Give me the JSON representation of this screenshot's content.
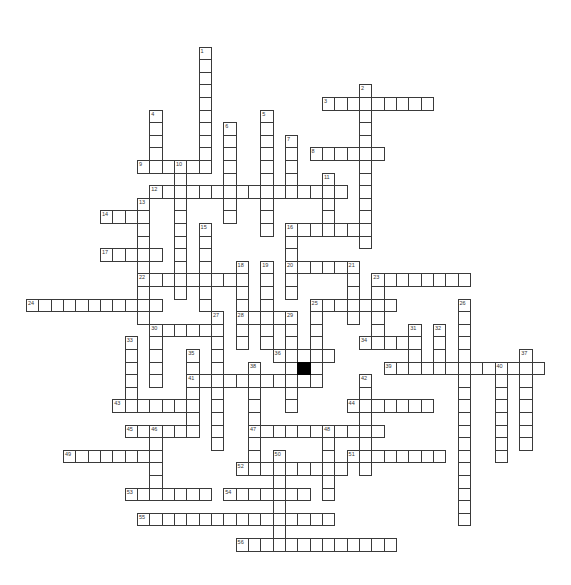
{
  "puzzle": {
    "type": "crossword",
    "grid": {
      "origin_x": 26,
      "origin_y": 46.6,
      "cell_w": 12.33,
      "cell_h": 12.6,
      "border_color": "#3a3a3a",
      "block_color": "#000000"
    },
    "blocked_cells": [
      [
        22,
        25
      ]
    ],
    "words": [
      {
        "number": "1",
        "dir": "down",
        "col": 14,
        "row": 0,
        "length": 10
      },
      {
        "number": "2",
        "dir": "down",
        "col": 27,
        "row": 3,
        "length": 13
      },
      {
        "number": "3",
        "dir": "across",
        "col": 24,
        "row": 4,
        "length": 9
      },
      {
        "number": "4",
        "dir": "down",
        "col": 10,
        "row": 5,
        "length": 5
      },
      {
        "number": "5",
        "dir": "down",
        "col": 19,
        "row": 5,
        "length": 10
      },
      {
        "number": "6",
        "dir": "down",
        "col": 16,
        "row": 6,
        "length": 8
      },
      {
        "number": "7",
        "dir": "down",
        "col": 21,
        "row": 7,
        "length": 5
      },
      {
        "number": "8",
        "dir": "across",
        "col": 23,
        "row": 8,
        "length": 6
      },
      {
        "number": "9",
        "dir": "across",
        "col": 9,
        "row": 9,
        "length": 6
      },
      {
        "number": "10",
        "dir": "down",
        "col": 12,
        "row": 9,
        "length": 11
      },
      {
        "number": "11",
        "dir": "down",
        "col": 24,
        "row": 10,
        "length": 5
      },
      {
        "number": "12",
        "dir": "across",
        "col": 10,
        "row": 11,
        "length": 16
      },
      {
        "number": "13",
        "dir": "down",
        "col": 9,
        "row": 12,
        "length": 10
      },
      {
        "number": "14",
        "dir": "across",
        "col": 6,
        "row": 13,
        "length": 4
      },
      {
        "number": "15",
        "dir": "down",
        "col": 14,
        "row": 14,
        "length": 7
      },
      {
        "number": "16",
        "dir": "across",
        "col": 21,
        "row": 14,
        "length": 7
      },
      {
        "number": "16",
        "dir": "down",
        "col": 21,
        "row": 14,
        "length": 6
      },
      {
        "number": "17",
        "dir": "across",
        "col": 6,
        "row": 16,
        "length": 5
      },
      {
        "number": "18",
        "dir": "down",
        "col": 17,
        "row": 17,
        "length": 7
      },
      {
        "number": "19",
        "dir": "down",
        "col": 19,
        "row": 17,
        "length": 7
      },
      {
        "number": "20",
        "dir": "across",
        "col": 21,
        "row": 17,
        "length": 6
      },
      {
        "number": "21",
        "dir": "down",
        "col": 26,
        "row": 17,
        "length": 5
      },
      {
        "number": "22",
        "dir": "across",
        "col": 9,
        "row": 18,
        "length": 9
      },
      {
        "number": "23",
        "dir": "across",
        "col": 28,
        "row": 18,
        "length": 8
      },
      {
        "number": "23",
        "dir": "down",
        "col": 28,
        "row": 18,
        "length": 6
      },
      {
        "number": "24",
        "dir": "across",
        "col": 0,
        "row": 20,
        "length": 11
      },
      {
        "number": "25",
        "dir": "across",
        "col": 23,
        "row": 20,
        "length": 7
      },
      {
        "number": "25",
        "dir": "down",
        "col": 23,
        "row": 20,
        "length": 7
      },
      {
        "number": "26",
        "dir": "down",
        "col": 35,
        "row": 20,
        "length": 18
      },
      {
        "number": "27",
        "dir": "down",
        "col": 15,
        "row": 21,
        "length": 11
      },
      {
        "number": "28",
        "dir": "across",
        "col": 17,
        "row": 21,
        "length": 5
      },
      {
        "number": "29",
        "dir": "down",
        "col": 21,
        "row": 21,
        "length": 8
      },
      {
        "number": "30",
        "dir": "across",
        "col": 10,
        "row": 22,
        "length": 6
      },
      {
        "number": "30",
        "dir": "down",
        "col": 10,
        "row": 22,
        "length": 5
      },
      {
        "number": "31",
        "dir": "down",
        "col": 31,
        "row": 22,
        "length": 4
      },
      {
        "number": "32",
        "dir": "down",
        "col": 33,
        "row": 22,
        "length": 4
      },
      {
        "number": "33",
        "dir": "down",
        "col": 8,
        "row": 23,
        "length": 6
      },
      {
        "number": "34",
        "dir": "across",
        "col": 27,
        "row": 23,
        "length": 5
      },
      {
        "number": "35",
        "dir": "down",
        "col": 13,
        "row": 24,
        "length": 7
      },
      {
        "number": "36",
        "dir": "across",
        "col": 20,
        "row": 24,
        "length": 5
      },
      {
        "number": "37",
        "dir": "down",
        "col": 40,
        "row": 24,
        "length": 8
      },
      {
        "number": "38",
        "dir": "down",
        "col": 18,
        "row": 25,
        "length": 9
      },
      {
        "number": "39",
        "dir": "across",
        "col": 29,
        "row": 25,
        "length": 13
      },
      {
        "number": "40",
        "dir": "down",
        "col": 38,
        "row": 25,
        "length": 8
      },
      {
        "number": "41",
        "dir": "across",
        "col": 13,
        "row": 26,
        "length": 11
      },
      {
        "number": "42",
        "dir": "down",
        "col": 27,
        "row": 26,
        "length": 8
      },
      {
        "number": "43",
        "dir": "across",
        "col": 7,
        "row": 28,
        "length": 7
      },
      {
        "number": "44",
        "dir": "across",
        "col": 26,
        "row": 28,
        "length": 7
      },
      {
        "number": "45",
        "dir": "across",
        "col": 8,
        "row": 30,
        "length": 6
      },
      {
        "number": "46",
        "dir": "down",
        "col": 10,
        "row": 30,
        "length": 6
      },
      {
        "number": "47",
        "dir": "across",
        "col": 18,
        "row": 30,
        "length": 11
      },
      {
        "number": "48",
        "dir": "down",
        "col": 24,
        "row": 30,
        "length": 6
      },
      {
        "number": "49",
        "dir": "across",
        "col": 3,
        "row": 32,
        "length": 8
      },
      {
        "number": "50",
        "dir": "down",
        "col": 20,
        "row": 32,
        "length": 8
      },
      {
        "number": "51",
        "dir": "across",
        "col": 26,
        "row": 32,
        "length": 8
      },
      {
        "number": "52",
        "dir": "across",
        "col": 17,
        "row": 33,
        "length": 9
      },
      {
        "number": "53",
        "dir": "across",
        "col": 8,
        "row": 35,
        "length": 7
      },
      {
        "number": "54",
        "dir": "across",
        "col": 16,
        "row": 35,
        "length": 7
      },
      {
        "number": "55",
        "dir": "across",
        "col": 9,
        "row": 37,
        "length": 16
      },
      {
        "number": "56",
        "dir": "across",
        "col": 17,
        "row": 39,
        "length": 13
      }
    ]
  }
}
